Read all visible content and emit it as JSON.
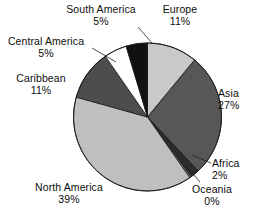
{
  "chart_data": {
    "type": "pie",
    "title": "",
    "subtitle": "",
    "xlabel": "",
    "ylabel": "",
    "legend_position": "none",
    "grid": false,
    "labels_show_percent": true,
    "categories": [
      "Europe",
      "Asia",
      "Africa",
      "Oceania",
      "North America",
      "Caribbean",
      "Central America",
      "South America"
    ],
    "values": [
      11,
      27,
      2,
      0,
      39,
      11,
      5,
      5
    ],
    "slices": [
      {
        "name": "Europe",
        "percent": 11,
        "percent_label": "11%",
        "color": "#c9c9c9",
        "start_angle": 0,
        "end_angle": 39.6
      },
      {
        "name": "Asia",
        "percent": 27,
        "percent_label": "27%",
        "color": "#575757",
        "start_angle": 39.6,
        "end_angle": 136.8
      },
      {
        "name": "Africa",
        "percent": 2,
        "percent_label": "2%",
        "color": "#2b2b2b",
        "start_angle": 136.8,
        "end_angle": 144.0
      },
      {
        "name": "Oceania",
        "percent": 0,
        "percent_label": "0%",
        "color": "#8a8a8a",
        "start_angle": 144.0,
        "end_angle": 145.2
      },
      {
        "name": "North America",
        "percent": 39,
        "percent_label": "39%",
        "color": "#bfbfbf",
        "start_angle": 145.2,
        "end_angle": 285.6
      },
      {
        "name": "Caribbean",
        "percent": 11,
        "percent_label": "11%",
        "color": "#4d4d4d",
        "start_angle": 285.6,
        "end_angle": 325.2
      },
      {
        "name": "Central America",
        "percent": 5,
        "percent_label": "5%",
        "color": "#ffffff",
        "start_angle": 325.2,
        "end_angle": 343.2
      },
      {
        "name": "South America",
        "percent": 5,
        "percent_label": "5%",
        "color": "#111111",
        "start_angle": 343.2,
        "end_angle": 360.0
      }
    ],
    "geometry": {
      "center_x": 147.5,
      "center_y": 117,
      "radius": 74
    }
  },
  "labels": {
    "europe": {
      "name": "Europe",
      "value": "11%"
    },
    "asia": {
      "name": "Asia",
      "value": "27%"
    },
    "africa": {
      "name": "Africa",
      "value": "2%"
    },
    "oceania": {
      "name": "Oceania",
      "value": "0%"
    },
    "north_america": {
      "name": "North America",
      "value": "39%"
    },
    "caribbean": {
      "name": "Caribbean",
      "value": "11%"
    },
    "central_america": {
      "name": "Central America",
      "value": "5%"
    },
    "south_america": {
      "name": "South America",
      "value": "5%"
    }
  }
}
